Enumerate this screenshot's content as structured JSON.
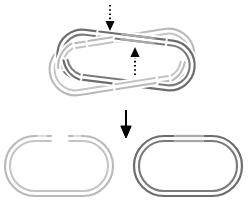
{
  "figure": {
    "title": "DNA catenane decatenation schematic",
    "caption": "",
    "background_color": "#ffffff",
    "width": 251,
    "height": 205
  },
  "colors": {
    "light_ring": "#b9b9b9",
    "light_ring_inner": "#c4c4c4",
    "dark_ring": "#6d6d6d",
    "dark_ring_inner": "#7a7a7a",
    "light_highlight": "#dcdcdc",
    "dark_highlight": "#a9a9a9",
    "arrow": "#000000",
    "background": "#ffffff"
  },
  "panels": [
    {
      "id": "catenane",
      "name": "interlinked-rings-panel",
      "label": "",
      "description": "Two interlinked oval rings, one light gray and one dark gray, crossing each other",
      "ring_count": 2
    },
    {
      "id": "product-left",
      "name": "light-open-ring-panel",
      "label": "",
      "description": "Single light gray open (nicked) oval ring with a gap in the top strand",
      "ring_count": 1
    },
    {
      "id": "product-right",
      "name": "dark-closed-ring-panel",
      "label": "",
      "description": "Single dark gray closed oval ring",
      "ring_count": 1
    }
  ],
  "rings": [
    {
      "id": "light-ring-top",
      "name": "light-gray-ring",
      "shade": "light",
      "state": "open",
      "color": "#b9b9b9"
    },
    {
      "id": "dark-ring-top",
      "name": "dark-gray-ring",
      "shade": "dark",
      "state": "closed",
      "color": "#6d6d6d"
    },
    {
      "id": "light-ring-product",
      "name": "light-gray-ring-product",
      "shade": "light",
      "state": "open",
      "color": "#b9b9b9"
    },
    {
      "id": "dark-ring-product",
      "name": "dark-gray-ring-product",
      "shade": "dark",
      "state": "closed",
      "color": "#6d6d6d"
    }
  ],
  "arrows": [
    {
      "id": "arrow-down-dotted",
      "name": "dotted-arrow-down",
      "style": "dotted",
      "direction": "down",
      "label": "",
      "color": "#0a0a0a"
    },
    {
      "id": "arrow-up-dotted",
      "name": "dotted-arrow-up",
      "style": "dotted",
      "direction": "up",
      "label": "",
      "color": "#0a0a0a"
    },
    {
      "id": "arrow-down-solid",
      "name": "solid-arrow-down",
      "style": "solid",
      "direction": "down",
      "label": "",
      "color": "#000000"
    }
  ]
}
